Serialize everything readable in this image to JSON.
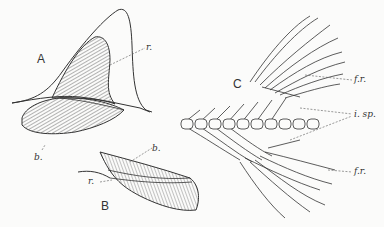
{
  "figure": {
    "panels": [
      {
        "id": "A",
        "label": "A",
        "annotations": [
          {
            "key": "r",
            "text": "r."
          },
          {
            "key": "b",
            "text": "b."
          }
        ]
      },
      {
        "id": "B",
        "label": "B",
        "annotations": [
          {
            "key": "b",
            "text": "b."
          },
          {
            "key": "r",
            "text": "r."
          }
        ]
      },
      {
        "id": "C",
        "label": "C",
        "annotations": [
          {
            "key": "fr_upper",
            "text": "f.r."
          },
          {
            "key": "isp",
            "text": "i. sp."
          },
          {
            "key": "fr_lower",
            "text": "f.r."
          }
        ]
      }
    ],
    "vertebra_count": 10,
    "colors": {
      "ink": "#333333",
      "paper": "#fbfbfa"
    }
  }
}
